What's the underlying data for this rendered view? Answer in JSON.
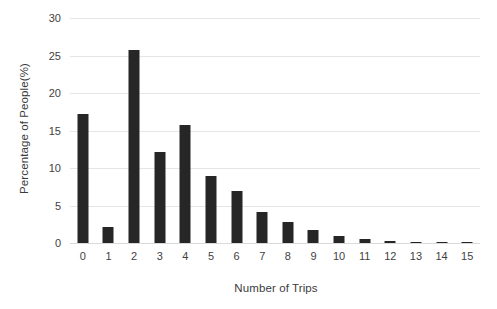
{
  "chart_data": {
    "type": "bar",
    "title": "",
    "subtitle": "",
    "xlabel": "Number of Trips",
    "ylabel": "Percentage of People(%)",
    "categories": [
      "0",
      "1",
      "2",
      "3",
      "4",
      "5",
      "6",
      "7",
      "8",
      "9",
      "10",
      "11",
      "12",
      "13",
      "14",
      "15"
    ],
    "values": [
      17.2,
      2.2,
      25.7,
      12.1,
      15.7,
      8.9,
      6.9,
      4.2,
      2.8,
      1.7,
      1.0,
      0.5,
      0.3,
      0.2,
      0.1,
      0.1
    ],
    "ylim": [
      0,
      30
    ],
    "yticks": [
      "0",
      "5",
      "10",
      "15",
      "20",
      "25",
      "30"
    ],
    "ytick_values": [
      0,
      5,
      10,
      15,
      20,
      25,
      30
    ],
    "xlim": [
      -0.5,
      15.5
    ],
    "grid": "horizontal",
    "legend": "none",
    "bar_color": "#262626",
    "gridline_color": "#e6e6e6",
    "axis_text_color": "#3f3f3f",
    "background_color": "#ffffff"
  }
}
